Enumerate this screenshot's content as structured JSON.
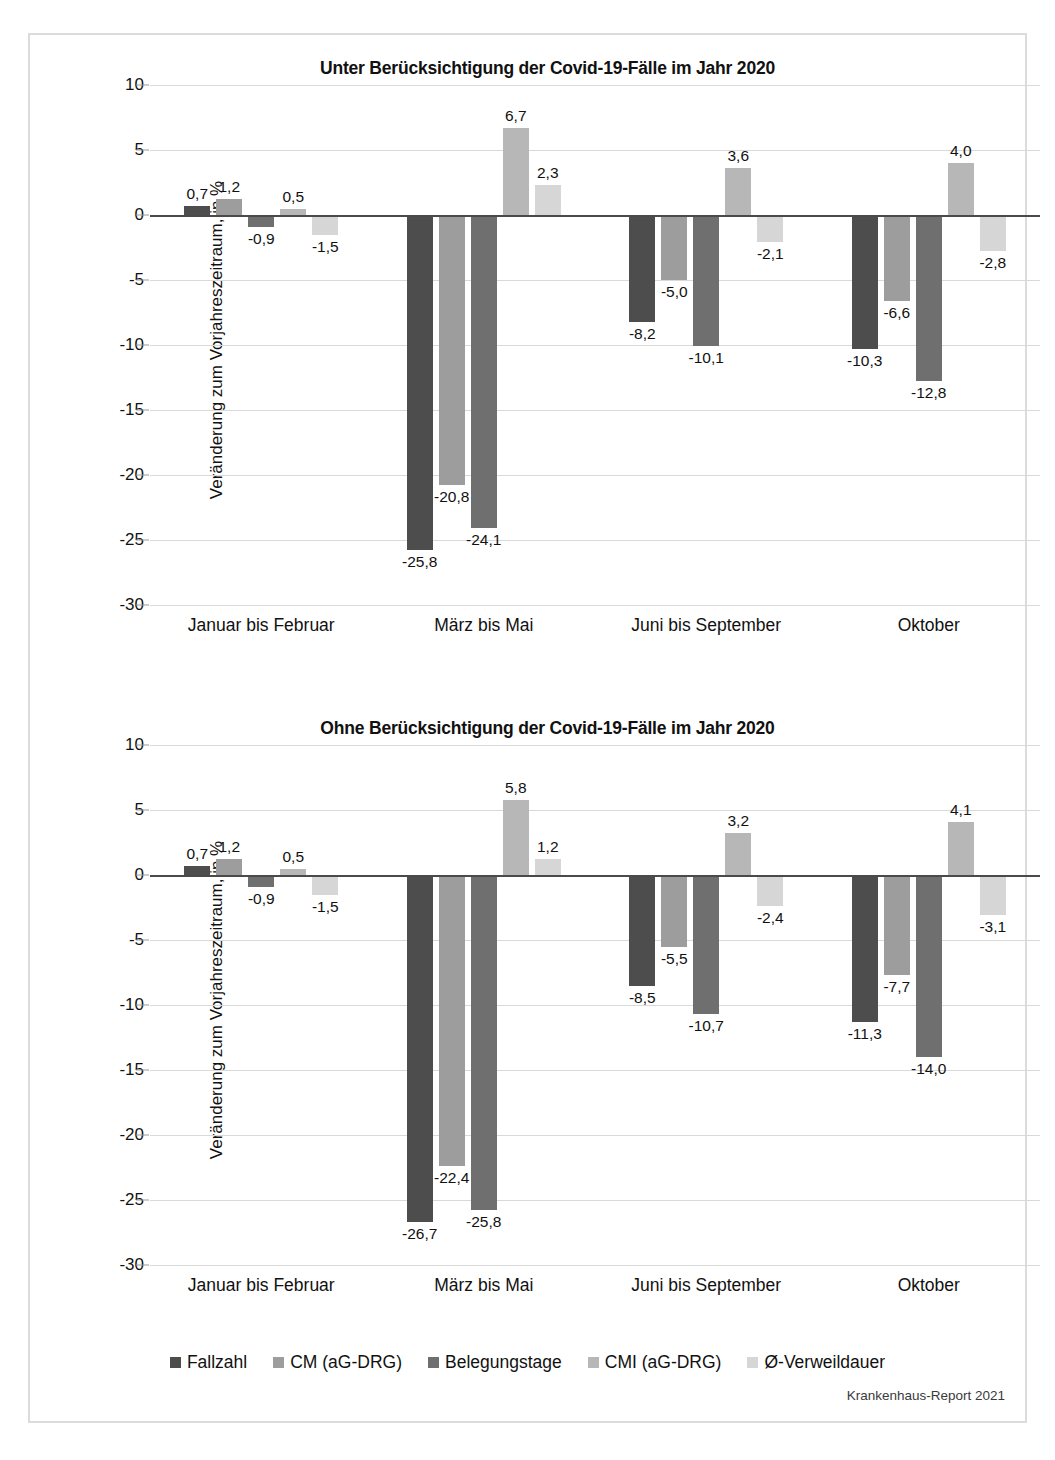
{
  "figure": {
    "footer_credit": "Krankenhaus-Report 2021",
    "ylabel": "Veränderung zum Vorjahreszeitraum, in %",
    "yticks": [
      "10",
      "5",
      "0",
      "-5",
      "-10",
      "-15",
      "-20",
      "-25",
      "-30"
    ],
    "categories": [
      "Januar bis Februar",
      "März bis Mai",
      "Juni bis September",
      "Oktober"
    ],
    "series_names": [
      "Fallzahl",
      "CM (aG-DRG)",
      "Belegungstage",
      "CMI (aG-DRG)",
      "Ø-Verweildauer"
    ],
    "series_colors": [
      "#4d4d4d",
      "#9d9d9d",
      "#6f6f6f",
      "#b7b7b7",
      "#d6d6d6"
    ]
  },
  "legend": {
    "items": [
      {
        "label": "Fallzahl",
        "color": "#4d4d4d"
      },
      {
        "label": "CM (aG-DRG)",
        "color": "#9d9d9d"
      },
      {
        "label": "Belegungstage",
        "color": "#6f6f6f"
      },
      {
        "label": "CMI (aG-DRG)",
        "color": "#b7b7b7"
      },
      {
        "label": "Ø-Verweildauer",
        "color": "#d6d6d6"
      }
    ]
  },
  "chart_data": [
    {
      "id": "chart-1",
      "type": "bar",
      "title": "Unter Berücksichtigung der Covid-19-Fälle im Jahr 2020",
      "xlabel": "",
      "ylabel": "Veränderung zum Vorjahreszeitraum, in %",
      "ylim": [
        -30,
        10
      ],
      "yticks": [
        10,
        5,
        0,
        -5,
        -10,
        -15,
        -20,
        -25,
        -30
      ],
      "grid": true,
      "legend_position": "bottom",
      "categories": [
        "Januar bis Februar",
        "März bis Mai",
        "Juni bis September",
        "Oktober"
      ],
      "series": [
        {
          "name": "Fallzahl",
          "color": "#4d4d4d",
          "values": [
            0.7,
            -25.8,
            -8.2,
            -10.3
          ],
          "labels": [
            "0,7",
            "-25,8",
            "-8,2",
            "-10,3"
          ]
        },
        {
          "name": "CM (aG-DRG)",
          "color": "#9d9d9d",
          "values": [
            1.2,
            -20.8,
            -5.0,
            -6.6
          ],
          "labels": [
            "1,2",
            "-20,8",
            "-5,0",
            "-6,6"
          ]
        },
        {
          "name": "Belegungstage",
          "color": "#6f6f6f",
          "values": [
            -0.9,
            -24.1,
            -10.1,
            -12.8
          ],
          "labels": [
            "-0,9",
            "-24,1",
            "-10,1",
            "-12,8"
          ]
        },
        {
          "name": "CMI (aG-DRG)",
          "color": "#b7b7b7",
          "values": [
            0.5,
            6.7,
            3.6,
            4.0
          ],
          "labels": [
            "0,5",
            "6,7",
            "3,6",
            "4,0"
          ]
        },
        {
          "name": "Ø-Verweildauer",
          "color": "#d6d6d6",
          "values": [
            -1.5,
            2.3,
            -2.1,
            -2.8
          ],
          "labels": [
            "-1,5",
            "2,3",
            "-2,1",
            "-2,8"
          ]
        }
      ]
    },
    {
      "id": "chart-2",
      "type": "bar",
      "title": "Ohne Berücksichtigung der Covid-19-Fälle im Jahr 2020",
      "xlabel": "",
      "ylabel": "Veränderung zum Vorjahreszeitraum, in %",
      "ylim": [
        -30,
        10
      ],
      "yticks": [
        10,
        5,
        0,
        -5,
        -10,
        -15,
        -20,
        -25,
        -30
      ],
      "grid": true,
      "legend_position": "bottom",
      "categories": [
        "Januar bis Februar",
        "März bis Mai",
        "Juni bis September",
        "Oktober"
      ],
      "series": [
        {
          "name": "Fallzahl",
          "color": "#4d4d4d",
          "values": [
            0.7,
            -26.7,
            -8.5,
            -11.3
          ],
          "labels": [
            "0,7",
            "-26,7",
            "-8,5",
            "-11,3"
          ]
        },
        {
          "name": "CM (aG-DRG)",
          "color": "#9d9d9d",
          "values": [
            1.2,
            -22.4,
            -5.5,
            -7.7
          ],
          "labels": [
            "1,2",
            "-22,4",
            "-5,5",
            "-7,7"
          ]
        },
        {
          "name": "Belegungstage",
          "color": "#6f6f6f",
          "values": [
            -0.9,
            -25.8,
            -10.7,
            -14.0
          ],
          "labels": [
            "-0,9",
            "-25,8",
            "-10,7",
            "-14,0"
          ]
        },
        {
          "name": "CMI (aG-DRG)",
          "color": "#b7b7b7",
          "values": [
            0.5,
            5.8,
            3.2,
            4.1
          ],
          "labels": [
            "0,5",
            "5,8",
            "3,2",
            "4,1"
          ]
        },
        {
          "name": "Ø-Verweildauer",
          "color": "#d6d6d6",
          "values": [
            -1.5,
            1.2,
            -2.4,
            -3.1
          ],
          "labels": [
            "-1,5",
            "1,2",
            "-2,4",
            "-3,1"
          ]
        }
      ]
    }
  ]
}
